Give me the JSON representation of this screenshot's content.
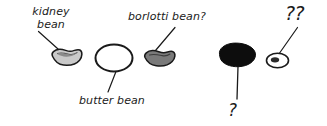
{
  "figure": {
    "background_color": "#ffffff",
    "ink_color": "#1a1a1a",
    "width": 327,
    "height": 126
  },
  "labels": {
    "kidney_bean": "kidney bean",
    "kidney_bean_line1": "kidney",
    "kidney_bean_line2": "bean",
    "butter_bean": "butter bean",
    "borlotti_bean": "borlotti bean?",
    "unknown_single": "?",
    "unknown_double": "??"
  },
  "specimens": [
    {
      "id": "kidney-bean",
      "label": "kidney bean",
      "fill_color": "#c9c9c9",
      "outline_color": "#1a1a1a",
      "shape": "kidney",
      "identified": true
    },
    {
      "id": "butter-bean",
      "label": "butter bean",
      "fill_color": "#ffffff",
      "outline_color": "#1a1a1a",
      "shape": "oval",
      "identified": true
    },
    {
      "id": "borlotti-bean",
      "label": "borlotti bean?",
      "fill_color": "#7a7a7a",
      "outline_color": "#1a1a1a",
      "shape": "kidney",
      "identified": false
    },
    {
      "id": "black-bean",
      "label": "?",
      "fill_color": "#0d0d0d",
      "outline_color": "#0d0d0d",
      "shape": "blob",
      "identified": false
    },
    {
      "id": "small-speckled-bean",
      "label": "??",
      "fill_color": "#ffffff",
      "outline_color": "#1a1a1a",
      "shape": "small-oval-with-speck",
      "identified": false
    }
  ]
}
